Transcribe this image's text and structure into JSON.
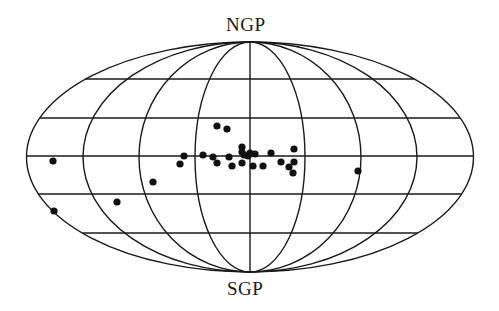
{
  "chart_data": {
    "type": "scatter",
    "projection": "aitoff-hammer (galactic sky map)",
    "title": "",
    "labels": {
      "top": "NGP",
      "bottom": "SGP"
    },
    "grid": true,
    "grid_latitude_lines": 5,
    "grid_meridians": 9,
    "line_color": "#1a1a1a",
    "point_color": "#111111",
    "points_pixel": [
      {
        "x": 53,
        "y": 161
      },
      {
        "x": 54,
        "y": 211
      },
      {
        "x": 117,
        "y": 202
      },
      {
        "x": 153,
        "y": 182
      },
      {
        "x": 180,
        "y": 164
      },
      {
        "x": 184,
        "y": 156
      },
      {
        "x": 203,
        "y": 155
      },
      {
        "x": 213,
        "y": 157
      },
      {
        "x": 217,
        "y": 163
      },
      {
        "x": 217,
        "y": 126
      },
      {
        "x": 227,
        "y": 129
      },
      {
        "x": 229,
        "y": 157
      },
      {
        "x": 232,
        "y": 166
      },
      {
        "x": 242,
        "y": 147
      },
      {
        "x": 242,
        "y": 152
      },
      {
        "x": 242,
        "y": 163
      },
      {
        "x": 244,
        "y": 155
      },
      {
        "x": 248,
        "y": 156
      },
      {
        "x": 250,
        "y": 153
      },
      {
        "x": 253,
        "y": 166
      },
      {
        "x": 255,
        "y": 154
      },
      {
        "x": 263,
        "y": 166
      },
      {
        "x": 271,
        "y": 153
      },
      {
        "x": 281,
        "y": 162
      },
      {
        "x": 289,
        "y": 167
      },
      {
        "x": 294,
        "y": 149
      },
      {
        "x": 294,
        "y": 162
      },
      {
        "x": 293,
        "y": 173
      },
      {
        "x": 358,
        "y": 171
      }
    ],
    "point_count": 29
  }
}
